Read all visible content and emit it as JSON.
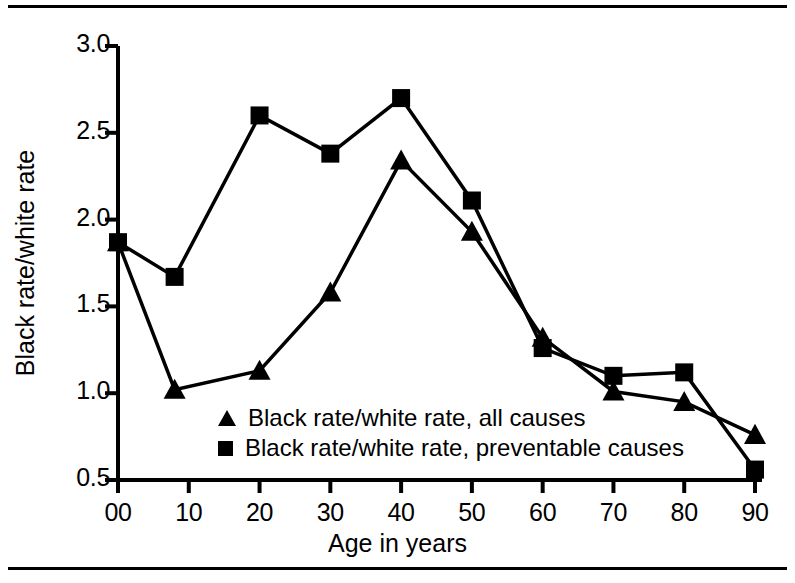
{
  "chart_data": {
    "type": "line",
    "title": "",
    "xlabel": "Age in years",
    "ylabel": "Black rate/white rate",
    "xlim": [
      0,
      90
    ],
    "ylim": [
      0.5,
      3.0
    ],
    "xticks": [
      "00",
      "10",
      "20",
      "30",
      "40",
      "50",
      "60",
      "70",
      "80",
      "90"
    ],
    "xtick_values": [
      0,
      10,
      20,
      30,
      40,
      50,
      60,
      70,
      80,
      90
    ],
    "yticks": [
      "0.5",
      "1.0",
      "1.5",
      "2.0",
      "2.5",
      "3.0"
    ],
    "ytick_values": [
      0.5,
      1.0,
      1.5,
      2.0,
      2.5,
      3.0
    ],
    "grid": false,
    "legend_position": "inside-lower-center",
    "x": [
      0,
      8,
      20,
      30,
      40,
      50,
      60,
      70,
      80,
      90
    ],
    "series": [
      {
        "name": "Black rate/white rate, all causes",
        "marker": "triangle",
        "color": "#000000",
        "values": [
          1.87,
          1.02,
          1.13,
          1.58,
          2.34,
          1.93,
          1.32,
          1.01,
          0.95,
          0.76
        ]
      },
      {
        "name": "Black rate/white rate, preventable causes",
        "marker": "square",
        "color": "#000000",
        "values": [
          1.87,
          1.67,
          2.6,
          2.38,
          2.7,
          2.11,
          1.26,
          1.1,
          1.12,
          0.56
        ]
      }
    ]
  },
  "legend": {
    "items": [
      {
        "marker": "triangle-marker",
        "label": "Black rate/white rate, all causes"
      },
      {
        "marker": "square-marker",
        "label": "Black rate/white rate, preventable causes"
      }
    ]
  },
  "axes": {
    "y_axis_title": "Black rate/white rate",
    "x_axis_title": "Age in years"
  }
}
